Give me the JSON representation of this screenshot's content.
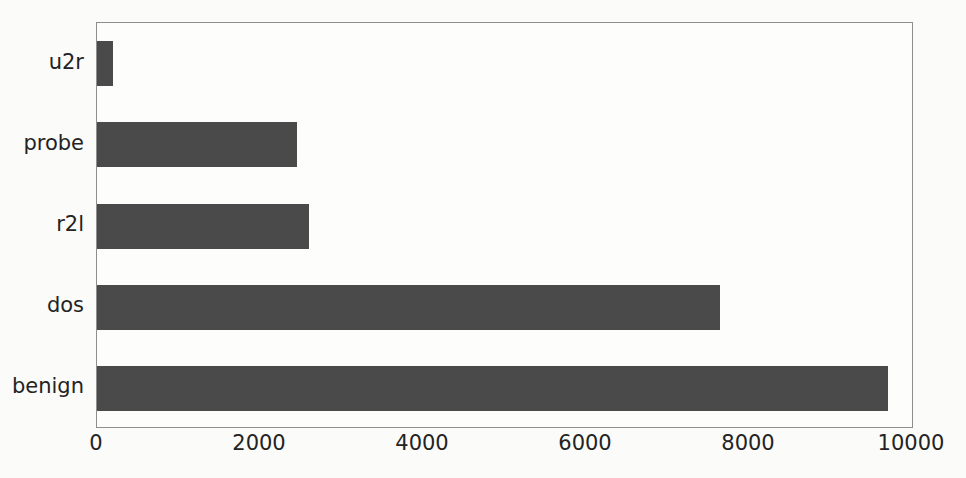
{
  "chart_data": {
    "type": "bar",
    "orientation": "horizontal",
    "title": "",
    "subtitle": "",
    "xlabel": "",
    "ylabel": "",
    "categories": [
      "benign",
      "dos",
      "r2l",
      "probe",
      "u2r"
    ],
    "values": [
      9700,
      7650,
      2600,
      2450,
      200
    ],
    "series": [
      {
        "name": "count",
        "values": [
          9700,
          7650,
          2600,
          2450,
          200
        ]
      }
    ],
    "xlim": [
      0,
      10000
    ],
    "xticks": [
      0,
      2000,
      4000,
      6000,
      8000,
      10000
    ],
    "xtick_labels": [
      "0",
      "2000",
      "4000",
      "6000",
      "8000",
      "10000"
    ],
    "ytick_labels": [
      "u2r",
      "probe",
      "r2l",
      "dos",
      "benign"
    ],
    "grid": false,
    "legend": null,
    "legend_position": "none",
    "annotations": []
  },
  "style": {
    "bar_color": "#4a4a4a",
    "plot_background": "#fdfdfc",
    "figure_background": "#fbfbfa",
    "axis_line_color": "#8e8e8e",
    "tick_text_color": "#232323"
  },
  "caption": {
    "remnant_text": ""
  }
}
